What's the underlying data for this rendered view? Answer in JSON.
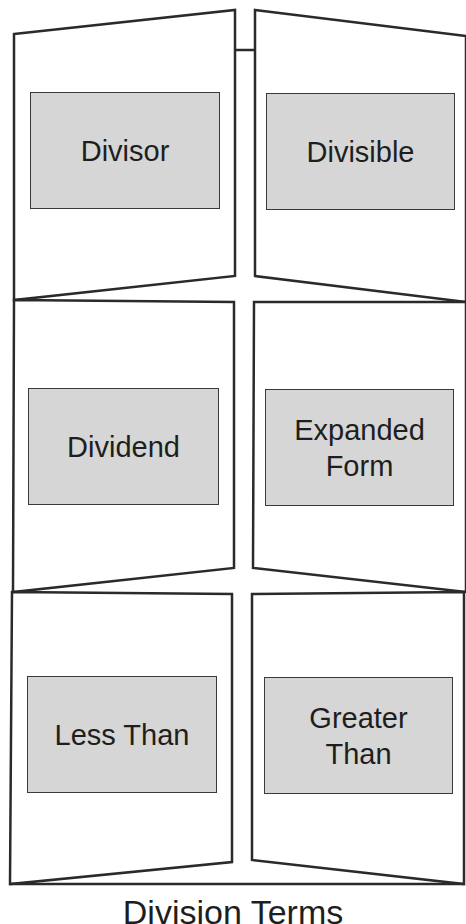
{
  "diagram": {
    "title": "Division Terms",
    "colors": {
      "outline": "#2a2a2a",
      "box_fill": "#d6d6d6",
      "text": "#1e1e1e",
      "background": "#ffffff"
    },
    "cells": [
      {
        "row": 1,
        "col": "left",
        "label": "Divisor"
      },
      {
        "row": 1,
        "col": "right",
        "label": "Divisible"
      },
      {
        "row": 2,
        "col": "left",
        "label": "Dividend"
      },
      {
        "row": 2,
        "col": "right",
        "label": "Expanded Form"
      },
      {
        "row": 3,
        "col": "left",
        "label": "Less Than"
      },
      {
        "row": 3,
        "col": "right",
        "label": "Greater Than"
      }
    ]
  }
}
